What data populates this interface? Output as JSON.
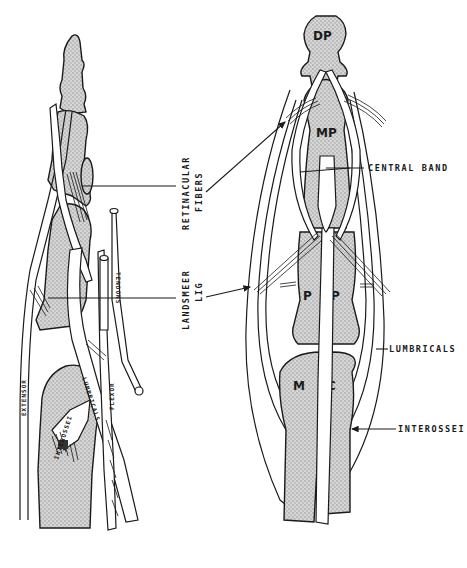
{
  "figure": {
    "type": "anatomical-illustration",
    "colors": {
      "ink": "#1a1a1a",
      "bone_fill": "#c8c8c8",
      "background": "#ffffff"
    },
    "left_view": {
      "name": "lateral view",
      "callout_labels": [
        {
          "id": "retinacular",
          "line1": "RETINACULAR",
          "line2": "FIBERS"
        },
        {
          "id": "landsmeer",
          "line1": "LANDSMEER",
          "line2": "LIG"
        }
      ],
      "structure_labels": {
        "tendons": "TENDONS",
        "extensor": "EXTENSOR",
        "lumbricals": "LUMBRICALS",
        "interossei": "INTEROSSEI",
        "flexor": "FLEXOR"
      }
    },
    "right_view": {
      "name": "dorsal view",
      "bone_labels": {
        "distal_phalanx": "DP",
        "middle_phalanx": "MP",
        "proximal_left": "P",
        "proximal_right": "P",
        "metacarpal_left": "M",
        "metacarpal_right": "C"
      },
      "callout_labels": {
        "central_band": "CENTRAL BAND",
        "lumbricals": "LUMBRICALS",
        "interossei": "INTEROSSEI"
      }
    }
  }
}
